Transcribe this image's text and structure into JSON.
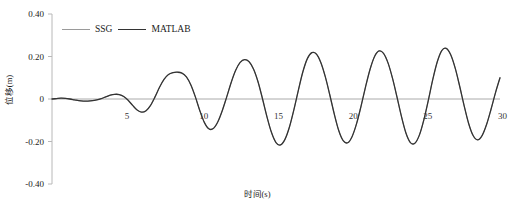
{
  "chart_data": {
    "type": "line",
    "title": "",
    "xlabel": "时间(s)",
    "ylabel": "位移(m)",
    "xlim": [
      0,
      30
    ],
    "ylim": [
      -0.4,
      0.4
    ],
    "xticks": [
      5,
      10,
      15,
      20,
      25,
      30
    ],
    "xtick_labels": [
      "5",
      "10",
      "15",
      "20",
      "25",
      "30"
    ],
    "yticks": [
      0.4,
      0.2,
      0,
      -0.2,
      -0.4
    ],
    "ytick_labels": [
      "0.40",
      "0.20",
      "0",
      "-0.20",
      "-0.40"
    ],
    "grid": false,
    "legend_position": "top-left",
    "zero_line": true,
    "series": [
      {
        "name": "SSG",
        "color": "#9a9a9a",
        "width": 1.0,
        "x": [
          0.0,
          0.3,
          0.6,
          0.9,
          1.2,
          1.5,
          1.8,
          2.1,
          2.4,
          2.7,
          3.0,
          3.3,
          3.6,
          3.9,
          4.2,
          4.5,
          4.8,
          5.1,
          5.4,
          5.7,
          6.0,
          6.3,
          6.6,
          6.9,
          7.2,
          7.5,
          7.8,
          8.1,
          8.4,
          8.7,
          9.0,
          9.3,
          9.6,
          9.9,
          10.2,
          10.5,
          10.8,
          11.1,
          11.4,
          11.7,
          12.0,
          12.3,
          12.6,
          12.9,
          13.2,
          13.5,
          13.8,
          14.1,
          14.4,
          14.7,
          15.0,
          15.3,
          15.6,
          15.9,
          16.2,
          16.5,
          16.8,
          17.1,
          17.4,
          17.7,
          18.0,
          18.3,
          18.6,
          18.9,
          19.2,
          19.5,
          19.8,
          20.1,
          20.4,
          20.7,
          21.0,
          21.3,
          21.6,
          21.9,
          22.2,
          22.5,
          22.8,
          23.1,
          23.4,
          23.7,
          24.0,
          24.3,
          24.6,
          24.9,
          25.2,
          25.5,
          25.8,
          26.1,
          26.4,
          26.7,
          27.0,
          27.3,
          27.6,
          27.9,
          28.2,
          28.5,
          28.8,
          29.1,
          29.4,
          29.7,
          30.0
        ],
        "y": [
          0.0,
          0.002,
          0.004,
          0.003,
          0.0,
          -0.004,
          -0.008,
          -0.01,
          -0.01,
          -0.008,
          -0.004,
          0.002,
          0.01,
          0.018,
          0.022,
          0.021,
          0.012,
          -0.006,
          -0.03,
          -0.052,
          -0.062,
          -0.055,
          -0.03,
          0.01,
          0.055,
          0.092,
          0.115,
          0.124,
          0.126,
          0.122,
          0.104,
          0.066,
          0.01,
          -0.055,
          -0.11,
          -0.14,
          -0.139,
          -0.108,
          -0.055,
          0.01,
          0.078,
          0.135,
          0.172,
          0.185,
          0.175,
          0.14,
          0.08,
          0.0,
          -0.085,
          -0.158,
          -0.205,
          -0.216,
          -0.19,
          -0.132,
          -0.05,
          0.042,
          0.128,
          0.19,
          0.218,
          0.212,
          0.172,
          0.105,
          0.02,
          -0.07,
          -0.148,
          -0.196,
          -0.206,
          -0.176,
          -0.115,
          -0.032,
          0.058,
          0.14,
          0.2,
          0.226,
          0.215,
          0.17,
          0.098,
          0.01,
          -0.082,
          -0.16,
          -0.205,
          -0.208,
          -0.17,
          -0.098,
          -0.006,
          0.092,
          0.175,
          0.228,
          0.238,
          0.208,
          0.145,
          0.06,
          -0.032,
          -0.115,
          -0.172,
          -0.192,
          -0.172,
          -0.12,
          -0.048,
          0.03,
          0.1
        ]
      },
      {
        "name": "MATLAB",
        "color": "#333333",
        "width": 1.3,
        "x": [
          0.0,
          0.3,
          0.6,
          0.9,
          1.2,
          1.5,
          1.8,
          2.1,
          2.4,
          2.7,
          3.0,
          3.3,
          3.6,
          3.9,
          4.2,
          4.5,
          4.8,
          5.1,
          5.4,
          5.7,
          6.0,
          6.3,
          6.6,
          6.9,
          7.2,
          7.5,
          7.8,
          8.1,
          8.4,
          8.7,
          9.0,
          9.3,
          9.6,
          9.9,
          10.2,
          10.5,
          10.8,
          11.1,
          11.4,
          11.7,
          12.0,
          12.3,
          12.6,
          12.9,
          13.2,
          13.5,
          13.8,
          14.1,
          14.4,
          14.7,
          15.0,
          15.3,
          15.6,
          15.9,
          16.2,
          16.5,
          16.8,
          17.1,
          17.4,
          17.7,
          18.0,
          18.3,
          18.6,
          18.9,
          19.2,
          19.5,
          19.8,
          20.1,
          20.4,
          20.7,
          21.0,
          21.3,
          21.6,
          21.9,
          22.2,
          22.5,
          22.8,
          23.1,
          23.4,
          23.7,
          24.0,
          24.3,
          24.6,
          24.9,
          25.2,
          25.5,
          25.8,
          26.1,
          26.4,
          26.7,
          27.0,
          27.3,
          27.6,
          27.9,
          28.2,
          28.5,
          28.8,
          29.1,
          29.4,
          29.7,
          30.0
        ],
        "y": [
          0.0,
          0.002,
          0.004,
          0.003,
          0.0,
          -0.004,
          -0.008,
          -0.01,
          -0.01,
          -0.008,
          -0.004,
          0.002,
          0.01,
          0.018,
          0.022,
          0.021,
          0.012,
          -0.006,
          -0.03,
          -0.052,
          -0.062,
          -0.055,
          -0.03,
          0.01,
          0.055,
          0.092,
          0.115,
          0.124,
          0.126,
          0.122,
          0.104,
          0.066,
          0.01,
          -0.055,
          -0.11,
          -0.14,
          -0.139,
          -0.108,
          -0.055,
          0.01,
          0.078,
          0.135,
          0.172,
          0.185,
          0.175,
          0.14,
          0.08,
          0.0,
          -0.085,
          -0.158,
          -0.205,
          -0.216,
          -0.19,
          -0.132,
          -0.05,
          0.042,
          0.128,
          0.19,
          0.218,
          0.212,
          0.172,
          0.105,
          0.02,
          -0.07,
          -0.148,
          -0.196,
          -0.206,
          -0.176,
          -0.115,
          -0.032,
          0.058,
          0.14,
          0.2,
          0.226,
          0.215,
          0.17,
          0.098,
          0.01,
          -0.082,
          -0.16,
          -0.205,
          -0.208,
          -0.17,
          -0.098,
          -0.006,
          0.092,
          0.175,
          0.228,
          0.238,
          0.208,
          0.145,
          0.06,
          -0.032,
          -0.115,
          -0.172,
          -0.192,
          -0.172,
          -0.12,
          -0.048,
          0.03,
          0.1
        ]
      }
    ],
    "annotations": []
  },
  "legend": {
    "items": [
      {
        "label": "SSG"
      },
      {
        "label": "MATLAB"
      }
    ]
  },
  "colors": {
    "axis": "#b8b8b8",
    "zero_line": "#aaaaaa",
    "ssg": "#9a9a9a",
    "matlab": "#333333",
    "background": "#ffffff"
  }
}
